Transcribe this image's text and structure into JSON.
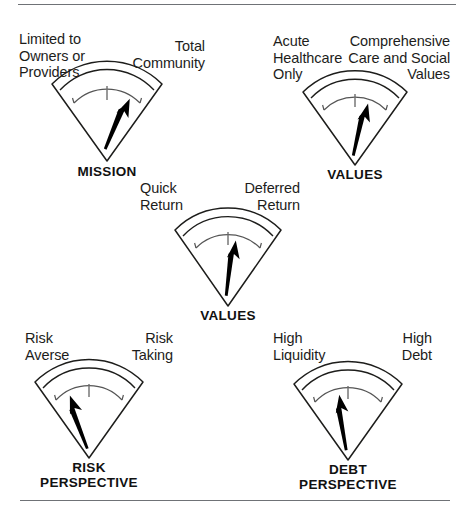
{
  "figure": {
    "type": "gauge-dial-diagram",
    "background": "#ffffff",
    "line_color": "#1d1d1b",
    "needle_color": "#000000",
    "rule_color": "#6f7276",
    "gauge_count": 5
  },
  "gauges": [
    {
      "id": "mission",
      "title": "MISSION",
      "left_label": "Limited to\nOwners or\nProviders",
      "right_label": "Total\nCommunity",
      "needle_direction": "up-right",
      "needle_angle_deg": 24
    },
    {
      "id": "values-care",
      "title": "VALUES",
      "left_label": "Acute\nHealthcare\nOnly",
      "right_label": "Comprehensive\nCare and Social\nValues",
      "needle_direction": "up-right",
      "needle_angle_deg": 14
    },
    {
      "id": "values-return",
      "title": "VALUES",
      "left_label": "Quick\nReturn",
      "right_label": "Deferred\nReturn",
      "needle_direction": "up-slightly-right",
      "needle_angle_deg": 8
    },
    {
      "id": "risk-perspective",
      "title": "RISK\nPERSPECTIVE",
      "left_label": "Risk\nAverse",
      "right_label": "Risk\nTaking",
      "needle_direction": "up-left",
      "needle_angle_deg": -20
    },
    {
      "id": "debt-perspective",
      "title": "DEBT\nPERSPECTIVE",
      "left_label": "High\nLiquidity",
      "right_label": "High\nDebt",
      "needle_direction": "up-slightly-left",
      "needle_angle_deg": -9
    }
  ]
}
